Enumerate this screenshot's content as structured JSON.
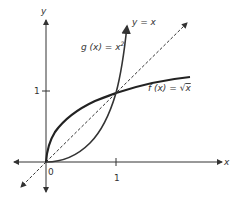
{
  "figure": {
    "axis_labels": {
      "x": "x",
      "y": "y"
    },
    "ticks": {
      "x": [
        "0",
        "1"
      ],
      "y": [
        "1"
      ]
    },
    "curves": [
      {
        "name": "g",
        "label": "g(x) = x²",
        "expr": "x^2"
      },
      {
        "name": "f",
        "label": "f(x) = √x",
        "expr": "sqrt(x)"
      },
      {
        "name": "identity",
        "label": "y = x",
        "expr": "x",
        "style": "dashed"
      }
    ],
    "label_parts": {
      "g_text": "g (x) = x",
      "g_sup": "2",
      "f_text": "f (x) = ",
      "f_rad": "√",
      "f_arg": "x",
      "id_text": "y = x"
    },
    "intersection_points": [
      [
        0,
        0
      ],
      [
        1,
        1
      ]
    ]
  }
}
